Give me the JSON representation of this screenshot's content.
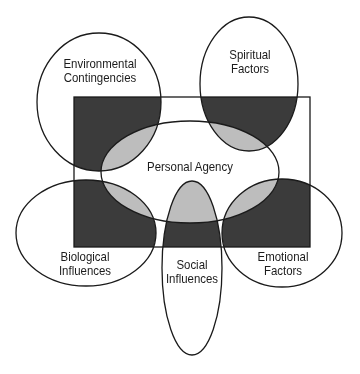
{
  "diagram": {
    "type": "venn-influences",
    "colors": {
      "background": "#ffffff",
      "outline": "#1a1a1a",
      "dark_fill": "#3b3b3b",
      "light_fill": "#bdbdbd"
    },
    "center": {
      "label": "Personal Agency"
    },
    "factors": [
      {
        "id": "environmental",
        "line1": "Environmental",
        "line2": "Contingencies"
      },
      {
        "id": "spiritual",
        "line1": "Spiritual",
        "line2": "Factors"
      },
      {
        "id": "biological",
        "line1": "Biological",
        "line2": "Influences"
      },
      {
        "id": "social",
        "line1": "Social",
        "line2": "Influences"
      },
      {
        "id": "emotional",
        "line1": "Emotional",
        "line2": "Factors"
      }
    ]
  }
}
